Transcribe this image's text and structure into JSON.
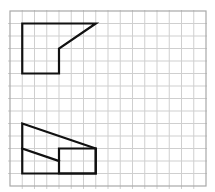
{
  "grid": {
    "columns": 16,
    "rows": 14,
    "origin_x": 10,
    "origin_y": 11,
    "cell_width": 12.25,
    "cell_height": 12.5,
    "grid_color": "#cfcfcf",
    "border_color": "#a8a8a8"
  },
  "figures": [
    {
      "name": "top-view-figure",
      "stroke": "#111111",
      "polygons": [
        [
          [
            1,
            1
          ],
          [
            7,
            1
          ],
          [
            4,
            3
          ],
          [
            4,
            5
          ],
          [
            1,
            5
          ]
        ]
      ],
      "lines": []
    },
    {
      "name": "front-view-figure",
      "stroke": "#111111",
      "polygons": [
        [
          [
            1,
            9
          ],
          [
            7,
            11
          ],
          [
            7,
            13
          ],
          [
            1,
            13
          ]
        ],
        [
          [
            4,
            11
          ],
          [
            7,
            11
          ],
          [
            7,
            13
          ],
          [
            4,
            13
          ]
        ]
      ],
      "lines": [
        [
          [
            1,
            11
          ],
          [
            4,
            12
          ]
        ]
      ]
    }
  ]
}
